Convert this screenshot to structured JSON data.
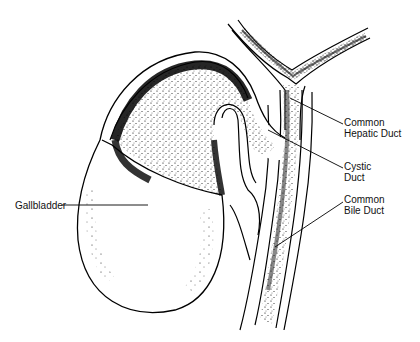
{
  "diagram": {
    "labels": [
      {
        "id": "gallbladder",
        "lines": [
          "Gallbladder"
        ]
      },
      {
        "id": "common-hepatic-duct",
        "lines": [
          "Common",
          "Hepatic Duct"
        ]
      },
      {
        "id": "cystic-duct",
        "lines": [
          "Cystic",
          "Duct"
        ]
      },
      {
        "id": "common-bile-duct",
        "lines": [
          "Common",
          "Bile Duct"
        ]
      }
    ]
  }
}
